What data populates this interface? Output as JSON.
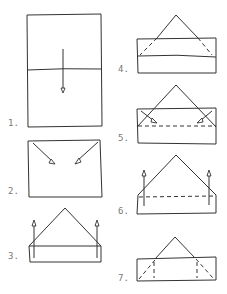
{
  "diagram": {
    "type": "folding-instructions",
    "steps": [
      {
        "label": "1.",
        "description": "rectangle with horizontal center fold line and downward arrow"
      },
      {
        "label": "2.",
        "description": "rectangle with arrows folding top corners inward"
      },
      {
        "label": "3.",
        "description": "triangle on strip with upward arrows"
      },
      {
        "label": "4.",
        "description": "triangle over strip with dashed fold lines"
      },
      {
        "label": "5.",
        "description": "triangle with dashed horizontal fold and inward corner arrows"
      },
      {
        "label": "6.",
        "description": "folded shape with dashed line and upward arrows"
      },
      {
        "label": "7.",
        "description": "small triangle on strip with dashed corner folds"
      }
    ],
    "colors": {
      "stroke": "#333333",
      "label": "#777777",
      "background": "#ffffff"
    }
  }
}
